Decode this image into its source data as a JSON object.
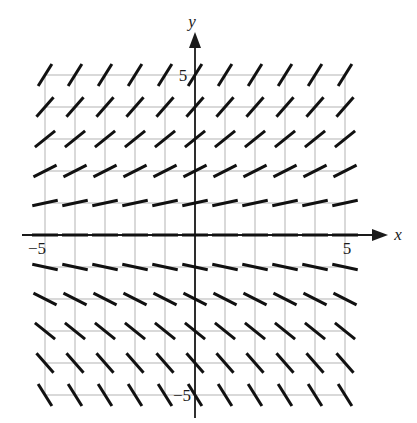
{
  "figure": {
    "kind": "slope-field",
    "title": "",
    "background_color": "#ffffff"
  },
  "axes": {
    "x_axis_label": "x",
    "y_axis_label": "y",
    "x_tick_labels": [
      {
        "text": "−5",
        "value": -5
      },
      {
        "text": "5",
        "value": 5
      }
    ],
    "y_tick_labels": [
      {
        "text": "5",
        "value": 5
      },
      {
        "text": "−5",
        "value": -5
      }
    ],
    "axis_color": "#1a1a1a",
    "grid_color": "#b3b3b3",
    "grid": true
  },
  "chart_data": {
    "type": "scatter",
    "subtype": "slope-field",
    "title": "",
    "xlabel": "x",
    "ylabel": "y",
    "xlim": [
      -5,
      5
    ],
    "ylim": [
      -5,
      5
    ],
    "xticks": [
      -5,
      5
    ],
    "yticks": [
      -5,
      5
    ],
    "grid": true,
    "legend": null,
    "slope_rule": "dy/dx = y",
    "tick_length": 26,
    "marker_color": "#111111",
    "marker_width": 3,
    "x": [
      -5,
      -4,
      -3,
      -2,
      -1,
      0,
      1,
      2,
      3,
      4,
      5
    ],
    "y": [
      5,
      4,
      3,
      2,
      1,
      0,
      -1,
      -2,
      -3,
      -4,
      -5
    ],
    "slopes_by_y": [
      {
        "y": 5,
        "slope": 1.6,
        "angle_deg": 58
      },
      {
        "y": 4,
        "slope": 1.15,
        "angle_deg": 49
      },
      {
        "y": 3,
        "slope": 0.8,
        "angle_deg": 39
      },
      {
        "y": 2,
        "slope": 0.5,
        "angle_deg": 27
      },
      {
        "y": 1,
        "slope": 0.22,
        "angle_deg": 12
      },
      {
        "y": 0,
        "slope": 0,
        "angle_deg": 0
      },
      {
        "y": -1,
        "slope": -0.22,
        "angle_deg": -12
      },
      {
        "y": -2,
        "slope": -0.5,
        "angle_deg": -27
      },
      {
        "y": -3,
        "slope": -0.8,
        "angle_deg": -39
      },
      {
        "y": -4,
        "slope": -1.15,
        "angle_deg": -49
      },
      {
        "y": -5,
        "slope": -1.6,
        "angle_deg": -58
      }
    ]
  }
}
